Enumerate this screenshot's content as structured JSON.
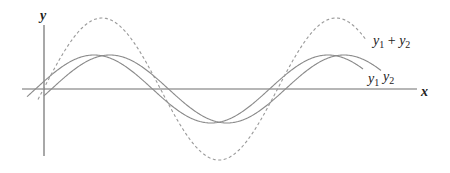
{
  "diagram": {
    "axes": {
      "x_label": "x",
      "y_label": "y"
    },
    "curves": [
      {
        "name": "y1",
        "label": "y",
        "subscript": "1",
        "style": "solid",
        "color": "#8a8a8a",
        "amplitude_px": 34,
        "phase_px": -6
      },
      {
        "name": "y2",
        "label": "y",
        "subscript": "2",
        "style": "solid",
        "color": "#8a8a8a",
        "amplitude_px": 34,
        "phase_px": 10
      },
      {
        "name": "y1+y2",
        "label": "y",
        "subscript_a": "1",
        "plus": " + ",
        "label_b": "y",
        "subscript_b": "2",
        "style": "dashed",
        "color": "#9a9a9a",
        "amplitude_px": 71
      }
    ],
    "colors": {
      "axis": "#6e6e6e",
      "text": "#222222"
    }
  }
}
